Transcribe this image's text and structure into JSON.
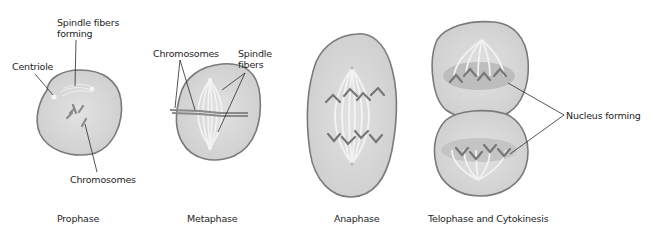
{
  "diagram": {
    "colors": {
      "cell_fill": "#d4d4d4",
      "cell_outline": "#7a7a7a",
      "chromosome": "#6e6e6e",
      "spindle": "#f2f2f2",
      "nucleus": "#bdbdbd",
      "leader_line": "#2a2a2a"
    },
    "stages": [
      {
        "caption": "Prophase",
        "labels": {
          "spindle_fibers_forming_line1": "Spindle fibers",
          "spindle_fibers_forming_line2": "forming",
          "centriole": "Centriole",
          "chromosomes": "Chromosomes"
        }
      },
      {
        "caption": "Metaphase",
        "labels": {
          "chromosomes": "Chromosomes",
          "spindle_fibers_line1": "Spindle",
          "spindle_fibers_line2": "fibers"
        }
      },
      {
        "caption": "Anaphase",
        "labels": {}
      },
      {
        "caption": "Telophase and Cytokinesis",
        "labels": {
          "nucleus_forming": "Nucleus forming"
        }
      }
    ]
  }
}
